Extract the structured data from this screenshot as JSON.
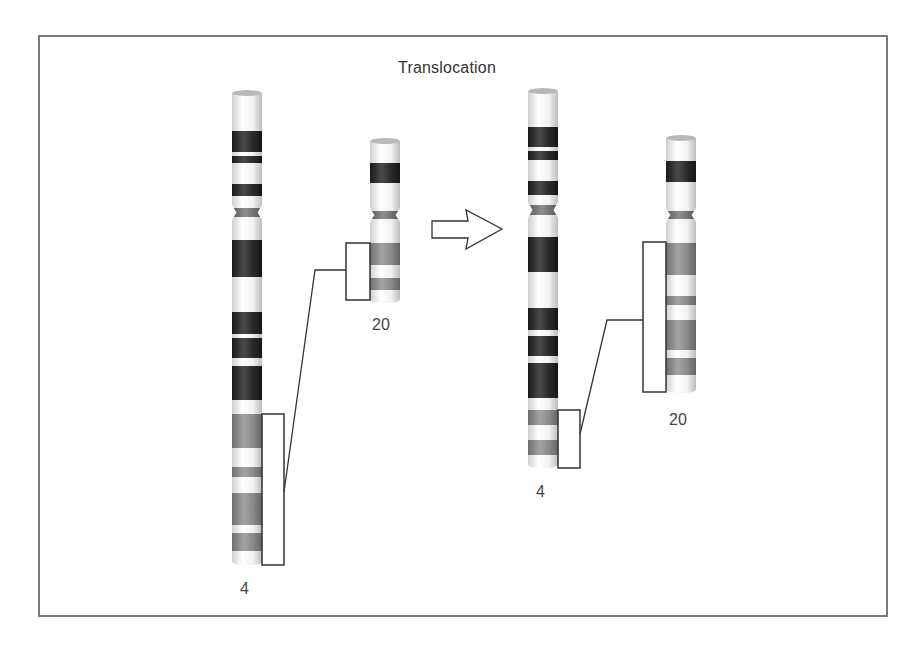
{
  "title": "Translocation",
  "colors": {
    "frame": "#7a7a7a",
    "dark_band": "#222222",
    "gray_band": "#8c8c8c",
    "light_band": "#f4f4f4",
    "centromere": "#6e6e6e",
    "outline": "#333333"
  },
  "before": {
    "chromosome_4": {
      "label": "4",
      "x": 232,
      "width": 30,
      "top": 90,
      "bottom": 565,
      "centromere": [
        205,
        220
      ],
      "bands": [
        {
          "y0": 131,
          "y1": 152,
          "type": "dark"
        },
        {
          "y0": 156,
          "y1": 163,
          "type": "dark"
        },
        {
          "y0": 184,
          "y1": 196,
          "type": "dark"
        },
        {
          "y0": 240,
          "y1": 277,
          "type": "dark"
        },
        {
          "y0": 312,
          "y1": 334,
          "type": "dark"
        },
        {
          "y0": 338,
          "y1": 358,
          "type": "dark"
        },
        {
          "y0": 366,
          "y1": 400,
          "type": "dark"
        },
        {
          "y0": 414,
          "y1": 448,
          "type": "gray"
        },
        {
          "y0": 467,
          "y1": 477,
          "type": "gray"
        },
        {
          "y0": 493,
          "y1": 525,
          "type": "gray"
        },
        {
          "y0": 533,
          "y1": 551,
          "type": "gray"
        }
      ],
      "bracket": {
        "x0": 262,
        "x1": 284,
        "y0": 414,
        "y1": 565
      }
    },
    "chromosome_20": {
      "label": "20",
      "x": 370,
      "width": 30,
      "top": 138,
      "bottom": 303,
      "centromere": [
        208,
        222
      ],
      "bands": [
        {
          "y0": 163,
          "y1": 183,
          "type": "dark"
        },
        {
          "y0": 243,
          "y1": 265,
          "type": "gray"
        },
        {
          "y0": 278,
          "y1": 290,
          "type": "gray"
        }
      ],
      "bracket": {
        "x0": 346,
        "x1": 370,
        "y0": 243,
        "y1": 300
      }
    },
    "connector": [
      [
        346,
        270
      ],
      [
        315,
        270
      ],
      [
        284,
        492
      ]
    ]
  },
  "arrow": {
    "label": "translocation-arrow"
  },
  "after": {
    "chromosome_4": {
      "label": "4",
      "x": 528,
      "width": 30,
      "top": 88,
      "bottom": 468,
      "centromere": [
        202,
        218
      ],
      "bands": [
        {
          "y0": 127,
          "y1": 147,
          "type": "dark"
        },
        {
          "y0": 151,
          "y1": 160,
          "type": "dark"
        },
        {
          "y0": 181,
          "y1": 195,
          "type": "dark"
        },
        {
          "y0": 237,
          "y1": 272,
          "type": "dark"
        },
        {
          "y0": 308,
          "y1": 330,
          "type": "dark"
        },
        {
          "y0": 336,
          "y1": 356,
          "type": "dark"
        },
        {
          "y0": 363,
          "y1": 398,
          "type": "dark"
        },
        {
          "y0": 410,
          "y1": 425,
          "type": "gray"
        },
        {
          "y0": 440,
          "y1": 455,
          "type": "gray"
        }
      ],
      "bracket": {
        "x0": 558,
        "x1": 580,
        "y0": 410,
        "y1": 468
      }
    },
    "chromosome_20": {
      "label": "20",
      "x": 666,
      "width": 30,
      "top": 135,
      "bottom": 393,
      "centromere": [
        208,
        222
      ],
      "bands": [
        {
          "y0": 161,
          "y1": 182,
          "type": "dark"
        },
        {
          "y0": 243,
          "y1": 275,
          "type": "gray"
        },
        {
          "y0": 296,
          "y1": 305,
          "type": "gray"
        },
        {
          "y0": 320,
          "y1": 350,
          "type": "gray"
        },
        {
          "y0": 358,
          "y1": 375,
          "type": "gray"
        }
      ],
      "bracket": {
        "x0": 643,
        "x1": 666,
        "y0": 242,
        "y1": 392
      }
    },
    "connector": [
      [
        643,
        320
      ],
      [
        607,
        320
      ],
      [
        580,
        434
      ]
    ]
  },
  "labels": [
    {
      "id": "before-4",
      "text": "4",
      "x": 240,
      "y": 580
    },
    {
      "id": "before-20",
      "text": "20",
      "x": 372,
      "y": 316
    },
    {
      "id": "after-4",
      "text": "4",
      "x": 536,
      "y": 483
    },
    {
      "id": "after-20",
      "text": "20",
      "x": 669,
      "y": 411
    }
  ]
}
